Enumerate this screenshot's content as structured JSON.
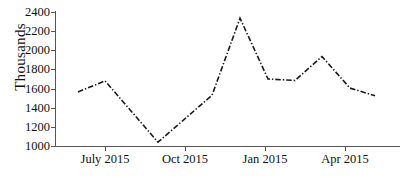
{
  "chart_data": {
    "type": "line",
    "title": "",
    "xlabel": "",
    "ylabel": "Thousands",
    "ylim": [
      1000,
      2400
    ],
    "ytick_values": [
      1000,
      1200,
      1400,
      1600,
      1800,
      2000,
      2200,
      2400
    ],
    "ytick_labels": [
      "1000",
      "1200",
      "1400",
      "1600",
      "1800",
      "2000",
      "2200",
      "2400"
    ],
    "xtick_labels": [
      "July 2015",
      "Oct 2015",
      "Jan 2015",
      "Apr 2015"
    ],
    "grid": false,
    "legend": false,
    "line_style": "dash-dot",
    "line_color": "#1a1a1a",
    "marker": "none",
    "x": [
      0,
      1,
      3,
      5,
      6,
      7,
      8,
      9,
      10,
      11
    ],
    "values": [
      1565,
      1680,
      1040,
      1530,
      2335,
      1700,
      1685,
      1935,
      1605,
      1525
    ],
    "series": [
      {
        "name": "",
        "points": [
          {
            "x": 78,
            "y": 1565
          },
          {
            "x": 105,
            "y": 1680
          },
          {
            "x": 158,
            "y": 1040
          },
          {
            "x": 212,
            "y": 1530
          },
          {
            "x": 240,
            "y": 2335
          },
          {
            "x": 268,
            "y": 1700
          },
          {
            "x": 295,
            "y": 1685
          },
          {
            "x": 322,
            "y": 1935
          },
          {
            "x": 350,
            "y": 1605
          },
          {
            "x": 375,
            "y": 1525
          }
        ]
      }
    ],
    "annotations": []
  },
  "axes": {
    "y_title": "Thousands",
    "y_ticks": [
      {
        "label": "2400",
        "value": 2400
      },
      {
        "label": "2200",
        "value": 2200
      },
      {
        "label": "2000",
        "value": 2000
      },
      {
        "label": "1800",
        "value": 1800
      },
      {
        "label": "1600",
        "value": 1600
      },
      {
        "label": "1400",
        "value": 1400
      },
      {
        "label": "1200",
        "value": 1200
      },
      {
        "label": "1000",
        "value": 1000
      }
    ],
    "x_ticks": [
      {
        "label": "July 2015",
        "px": 105
      },
      {
        "label": "Oct 2015",
        "px": 185
      },
      {
        "label": "Jan 2015",
        "px": 265
      },
      {
        "label": "Apr 2015",
        "px": 345
      }
    ],
    "axis_color": "#555555"
  }
}
